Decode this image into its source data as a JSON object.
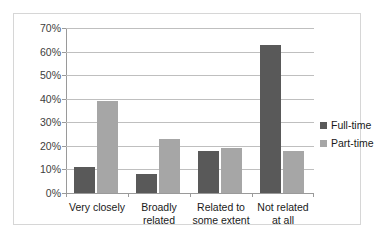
{
  "chart_data": {
    "type": "bar",
    "title": "",
    "subtitle": "",
    "xlabel": "",
    "ylabel": "",
    "categories": [
      "Very closely",
      "Broadly related",
      "Related to some extent",
      "Not related at all"
    ],
    "category_lines": [
      [
        "Very closely"
      ],
      [
        "Broadly",
        "related"
      ],
      [
        "Related to",
        "some extent"
      ],
      [
        "Not related",
        "at all"
      ]
    ],
    "series": [
      {
        "name": "Full-time",
        "color": "#595959",
        "values": [
          11,
          8,
          18,
          63
        ]
      },
      {
        "name": "Part-time",
        "color": "#a6a6a6",
        "values": [
          39,
          23,
          19,
          18
        ]
      }
    ],
    "ylim": [
      0,
      70
    ],
    "ytick_step": 10,
    "ytick_labels": [
      "70%",
      "60%",
      "50%",
      "40%",
      "30%",
      "20%",
      "10%",
      "0%"
    ],
    "ytick_values": [
      70,
      60,
      50,
      40,
      30,
      20,
      10,
      0
    ],
    "grid": true,
    "legend_position": "right",
    "value_suffix": "%"
  },
  "legend": {
    "items": [
      {
        "label": "Full-time",
        "color": "#595959"
      },
      {
        "label": "Part-time",
        "color": "#a6a6a6"
      }
    ]
  },
  "colors": {
    "full_time": "#595959",
    "part_time": "#a6a6a6",
    "gridline": "#bfbfbf",
    "axis": "#9a9a9a",
    "frame_border": "#d6d6d6",
    "text": "#1a1a1a",
    "background": "#ffffff"
  }
}
